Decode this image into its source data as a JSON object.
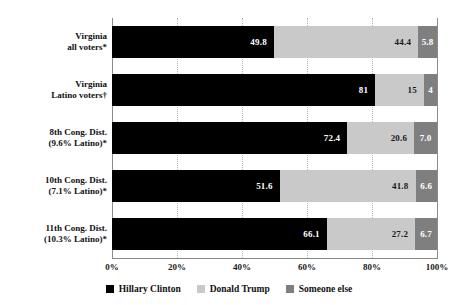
{
  "chart_data": {
    "type": "bar",
    "orientation": "horizontal",
    "stacked": true,
    "title": "",
    "subtitle": "",
    "xlabel": "",
    "ylabel": "",
    "xlim": [
      0,
      100
    ],
    "grid": true,
    "legend_position": "bottom",
    "categories": [
      "Virginia\nall voters*",
      "Virginia\nLatino voters†",
      "8th Cong. Dist.\n(9.6% Latino)*",
      "10th Cong. Dist.\n(7.1% Latino)*",
      "11th Cong. Dist.\n(10.3% Latino)*"
    ],
    "series": [
      {
        "name": "Hillary Clinton",
        "color": "#000000",
        "values": [
          49.8,
          81,
          72.4,
          51.6,
          66.1
        ],
        "labels": [
          "49.8",
          "81",
          "72.4",
          "51.6",
          "66.1"
        ]
      },
      {
        "name": "Donald Trump",
        "color": "#c9c9c9",
        "values": [
          44.4,
          15,
          20.6,
          41.8,
          27.2
        ],
        "labels": [
          "44.4",
          "15",
          "20.6",
          "41.8",
          "27.2"
        ]
      },
      {
        "name": "Someone else",
        "color": "#7f7f7f",
        "values": [
          5.8,
          4,
          7.0,
          6.6,
          6.7
        ],
        "labels": [
          "5.8",
          "4",
          "7.0",
          "6.6",
          "6.7"
        ]
      }
    ],
    "xticks": [
      0,
      20,
      40,
      60,
      80,
      100
    ],
    "xticklabels": [
      "0%",
      "20%",
      "40%",
      "60%",
      "80%",
      "100%"
    ]
  },
  "legend": {
    "items": [
      {
        "label": "Hillary Clinton",
        "color": "#000000"
      },
      {
        "label": "Donald Trump",
        "color": "#c9c9c9"
      },
      {
        "label": "Someone else",
        "color": "#7f7f7f"
      }
    ]
  }
}
